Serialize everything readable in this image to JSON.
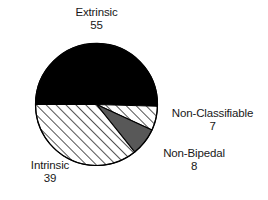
{
  "chart_data": {
    "type": "pie",
    "title": "",
    "subtitle": "",
    "xlabel": "",
    "ylabel": "",
    "legend_position": "none",
    "grid": false,
    "total": 109,
    "categories": [
      "Extrinsic",
      "Non-Classifiable",
      "Non-Bipedal",
      "Intrinsic"
    ],
    "values": [
      55,
      7,
      8,
      39
    ],
    "slices": [
      {
        "label": "Extrinsic",
        "value": 55,
        "value_text": "55",
        "fill_style": "solid-black",
        "color": "#000000",
        "start_angle_deg": 180,
        "end_angle_deg": 361.7
      },
      {
        "label": "Non-Classifiable",
        "value": 7,
        "value_text": "7",
        "fill_style": "diagonal-hatch",
        "color": "#ffffff",
        "start_angle_deg": 361.7,
        "end_angle_deg": 384.8
      },
      {
        "label": "Non-Bipedal",
        "value": 8,
        "value_text": "8",
        "fill_style": "solid-gray",
        "color": "#585858",
        "start_angle_deg": 384.8,
        "end_angle_deg": 411.2
      },
      {
        "label": "Intrinsic",
        "value": 39,
        "value_text": "39",
        "fill_style": "diagonal-hatch",
        "color": "#ffffff",
        "start_angle_deg": 411.2,
        "end_angle_deg": 540
      }
    ],
    "geometry": {
      "center_x": 96.5,
      "center_y": 104.5,
      "radius": 61
    },
    "style": {
      "background": "#ffffff",
      "outline_color": "#000000",
      "hatch_color": "#1a1a1a",
      "gray_fill": "#585858",
      "black_fill": "#000000",
      "text_color": "#181818"
    }
  },
  "labels": {
    "extrinsic": {
      "name": "Extrinsic",
      "value": "55"
    },
    "non_classifiable": {
      "name": "Non-Classifiable",
      "value": "7"
    },
    "non_bipedal": {
      "name": "Non-Bipedal",
      "value": "8"
    },
    "intrinsic": {
      "name": "Intrinsic",
      "value": "39"
    }
  }
}
